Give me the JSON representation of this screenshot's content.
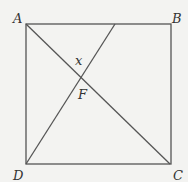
{
  "diagram": {
    "type": "geometry",
    "labels": {
      "A": "A",
      "B": "B",
      "C": "C",
      "D": "D",
      "F": "F",
      "x": "x"
    },
    "colors": {
      "line": "#555555",
      "text": "#333333",
      "background": "#f3f3f1"
    }
  }
}
